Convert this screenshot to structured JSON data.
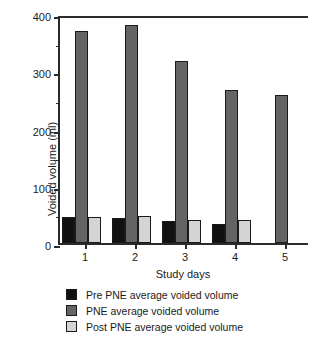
{
  "chart_data": {
    "type": "bar",
    "title": "",
    "xlabel": "Study days",
    "ylabel": "Voided volume (ml)",
    "categories": [
      "1",
      "2",
      "3",
      "4",
      "5"
    ],
    "ylim": [
      0,
      400
    ],
    "yticks": [
      0,
      100,
      200,
      300,
      400
    ],
    "ytick_labels": [
      "0",
      "100",
      "200",
      "300",
      "400"
    ],
    "yminor_ticks": [
      50,
      150,
      250,
      350
    ],
    "grid": false,
    "legend_position": "below",
    "series": [
      {
        "name": "Pre PNE average voided volume",
        "color": "#111111",
        "values": [
          46,
          44,
          39,
          34,
          null
        ]
      },
      {
        "name": "PNE average voided volume",
        "color": "#646464",
        "values": [
          371,
          381,
          318,
          268,
          259
        ]
      },
      {
        "name": "Post PNE average voided volume",
        "color": "#d4d4d4",
        "values": [
          46,
          47,
          41,
          41,
          null
        ]
      }
    ]
  },
  "axes": {
    "y_title": "Voided volume (ml)",
    "x_title": "Study days"
  },
  "legend": {
    "items": [
      {
        "label": "Pre PNE average voided volume",
        "color": "#111111"
      },
      {
        "label": "PNE average voided volume",
        "color": "#646464"
      },
      {
        "label": "Post PNE average voided volume",
        "color": "#d4d4d4"
      }
    ]
  }
}
